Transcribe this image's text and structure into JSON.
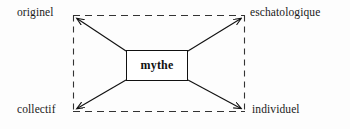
{
  "diagram": {
    "title": "mythe",
    "center": {
      "label": "mythe"
    },
    "corners": {
      "top_left": {
        "label": "originel"
      },
      "top_right": {
        "label": "eschatologique"
      },
      "bottom_left": {
        "label": "collectif"
      },
      "bottom_right": {
        "label": "individuel"
      }
    },
    "axes": {
      "horizontal_top": {
        "from": "originel",
        "to": "eschatologique",
        "style": "dashed"
      },
      "horizontal_bottom": {
        "from": "collectif",
        "to": "individuel",
        "style": "dashed"
      },
      "vertical_left": {
        "from": "originel",
        "to": "collectif",
        "style": "dashed"
      },
      "vertical_right": {
        "from": "eschatologique",
        "to": "individuel",
        "style": "dashed"
      }
    },
    "connectors": [
      {
        "from": "mythe",
        "to": "originel",
        "style": "solid",
        "arrow": true
      },
      {
        "from": "mythe",
        "to": "eschatologique",
        "style": "solid",
        "arrow": true
      },
      {
        "from": "mythe",
        "to": "collectif",
        "style": "solid",
        "arrow": true
      },
      {
        "from": "mythe",
        "to": "individuel",
        "style": "solid",
        "arrow": true
      }
    ],
    "colors": {
      "stroke": "#111111",
      "dashed_stroke": "#333333",
      "background": "#fdfdfd",
      "box_fill": "#ffffff",
      "text": "#1a1a1a"
    }
  }
}
